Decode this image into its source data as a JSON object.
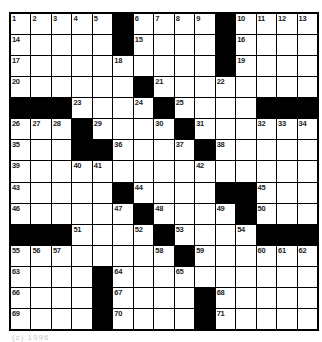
{
  "page": {
    "background": "#ffffff",
    "kind": "crossword-puzzle"
  },
  "grid": {
    "rows": 15,
    "cols": 15,
    "line_color": "#000000",
    "black_square_color": "#000000",
    "white_square_color": "#ffffff",
    "number_color": "#1c1c1c",
    "cells": [
      [
        "1",
        "2",
        "3",
        "4",
        "5",
        "#",
        "6",
        "7",
        "8",
        "9",
        "#",
        "10",
        "11",
        "12",
        "13"
      ],
      [
        "14",
        "",
        "",
        "",
        "",
        "#",
        "15",
        "",
        "",
        "",
        "#",
        "16",
        "",
        "",
        ""
      ],
      [
        "17",
        "",
        "",
        "",
        "",
        "18",
        "",
        "",
        "",
        "",
        "#",
        "19",
        "",
        "",
        ""
      ],
      [
        "20",
        "",
        "",
        "",
        "",
        "",
        "#",
        "21",
        "",
        "",
        "22",
        "",
        "",
        "",
        ""
      ],
      [
        "#",
        "#",
        "#",
        "23",
        "",
        "",
        "24",
        "#",
        "25",
        "",
        "",
        "",
        "#",
        "#",
        "#"
      ],
      [
        "26",
        "27",
        "28",
        "#",
        "29",
        "",
        "",
        "30",
        "#",
        "31",
        "",
        "",
        "32",
        "33",
        "34"
      ],
      [
        "35",
        "",
        "",
        "#",
        "#",
        "36",
        "",
        "",
        "37",
        "#",
        "38",
        "",
        "",
        "",
        ""
      ],
      [
        "39",
        "",
        "",
        "40",
        "41",
        "",
        "",
        "",
        "",
        "42",
        "",
        "",
        "",
        "",
        ""
      ],
      [
        "43",
        "",
        "",
        "",
        "",
        "#",
        "44",
        "",
        "",
        "",
        "#",
        "#",
        "45",
        "",
        ""
      ],
      [
        "46",
        "",
        "",
        "",
        "",
        "47",
        "#",
        "48",
        "",
        "",
        "49",
        "#",
        "50",
        "",
        ""
      ],
      [
        "#",
        "#",
        "#",
        "51",
        "",
        "",
        "52",
        "#",
        "53",
        "",
        "",
        "54",
        "#",
        "#",
        "#"
      ],
      [
        "55",
        "56",
        "57",
        "",
        "",
        "",
        "",
        "58",
        "#",
        "59",
        "",
        "",
        "60",
        "61",
        "62"
      ],
      [
        "63",
        "",
        "",
        "",
        "#",
        "64",
        "",
        "",
        "65",
        "",
        "",
        "",
        "",
        "",
        ""
      ],
      [
        "66",
        "",
        "",
        "",
        "#",
        "67",
        "",
        "",
        "",
        "#",
        "68",
        "",
        "",
        "",
        ""
      ],
      [
        "69",
        "",
        "",
        "",
        "#",
        "70",
        "",
        "",
        "",
        "#",
        "71",
        "",
        "",
        "",
        ""
      ]
    ]
  },
  "footer": {
    "copyright_fragment": "(c) 1996"
  }
}
